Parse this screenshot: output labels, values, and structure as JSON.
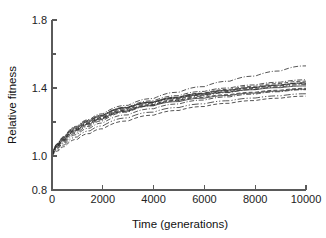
{
  "chart_data": {
    "type": "line",
    "title": "",
    "xlabel": "Time (generations)",
    "ylabel": "Relative fitness",
    "xlim": [
      0,
      10000
    ],
    "ylim": [
      0.8,
      1.8
    ],
    "grid": false,
    "legend": "none",
    "x_ticks": [
      0,
      2000,
      4000,
      6000,
      8000,
      10000
    ],
    "x_tick_labels": [
      "0",
      "2000",
      "4000",
      "6000",
      "8000",
      "10000"
    ],
    "y_ticks": [
      0.8,
      1.0,
      1.2,
      1.4,
      1.6,
      1.8
    ],
    "y_tick_labels": [
      "0.8",
      "1.0",
      "",
      "1.4",
      "",
      "1.8"
    ],
    "y_minor_ticks": [
      1.2,
      1.6
    ],
    "x": [
      0,
      250,
      500,
      1000,
      1500,
      2000,
      3000,
      4000,
      5000,
      6000,
      7000,
      8000,
      9000,
      10000
    ],
    "series": [
      {
        "name": "population-1",
        "style": "dash-dot",
        "values": [
          1.0,
          1.075,
          1.115,
          1.175,
          1.215,
          1.248,
          1.298,
          1.338,
          1.375,
          1.408,
          1.44,
          1.47,
          1.5,
          1.53
        ]
      },
      {
        "name": "population-2",
        "style": "dash-dot",
        "values": [
          1.0,
          1.07,
          1.108,
          1.165,
          1.205,
          1.238,
          1.288,
          1.325,
          1.355,
          1.38,
          1.4,
          1.418,
          1.434,
          1.448
        ]
      },
      {
        "name": "population-3",
        "style": "dashed",
        "values": [
          1.0,
          1.062,
          1.098,
          1.155,
          1.196,
          1.228,
          1.278,
          1.315,
          1.345,
          1.37,
          1.392,
          1.41,
          1.426,
          1.44
        ]
      },
      {
        "name": "population-4",
        "style": "solid",
        "values": [
          1.0,
          1.068,
          1.105,
          1.162,
          1.202,
          1.234,
          1.283,
          1.318,
          1.346,
          1.368,
          1.387,
          1.403,
          1.417,
          1.43
        ]
      },
      {
        "name": "population-5",
        "style": "dash-dot",
        "values": [
          1.0,
          1.058,
          1.092,
          1.148,
          1.19,
          1.222,
          1.272,
          1.31,
          1.34,
          1.364,
          1.385,
          1.402,
          1.417,
          1.43
        ]
      },
      {
        "name": "population-6",
        "style": "dashed",
        "values": [
          1.0,
          1.055,
          1.088,
          1.142,
          1.182,
          1.214,
          1.264,
          1.302,
          1.333,
          1.358,
          1.379,
          1.397,
          1.412,
          1.426
        ]
      },
      {
        "name": "population-7",
        "style": "solid",
        "values": [
          1.0,
          1.072,
          1.112,
          1.17,
          1.21,
          1.24,
          1.285,
          1.316,
          1.34,
          1.36,
          1.376,
          1.39,
          1.402,
          1.412
        ]
      },
      {
        "name": "population-8",
        "style": "dash-dot",
        "values": [
          1.0,
          1.05,
          1.082,
          1.135,
          1.175,
          1.207,
          1.258,
          1.296,
          1.327,
          1.352,
          1.373,
          1.391,
          1.406,
          1.42
        ]
      },
      {
        "name": "population-9",
        "style": "dashed",
        "values": [
          1.0,
          1.064,
          1.1,
          1.156,
          1.194,
          1.224,
          1.27,
          1.302,
          1.326,
          1.345,
          1.361,
          1.375,
          1.387,
          1.398
        ]
      },
      {
        "name": "population-10",
        "style": "solid",
        "values": [
          1.0,
          1.06,
          1.095,
          1.15,
          1.188,
          1.218,
          1.264,
          1.296,
          1.32,
          1.34,
          1.356,
          1.37,
          1.382,
          1.393
        ]
      },
      {
        "name": "population-11",
        "style": "dash-dot",
        "values": [
          1.0,
          1.045,
          1.075,
          1.126,
          1.164,
          1.194,
          1.242,
          1.278,
          1.306,
          1.329,
          1.348,
          1.364,
          1.378,
          1.39
        ]
      },
      {
        "name": "population-12",
        "style": "dash-dot-long",
        "values": [
          1.0,
          1.038,
          1.065,
          1.112,
          1.148,
          1.177,
          1.224,
          1.258,
          1.285,
          1.307,
          1.325,
          1.341,
          1.354,
          1.366
        ]
      },
      {
        "name": "population-13",
        "style": "dashed",
        "values": [
          1.0,
          1.03,
          1.055,
          1.098,
          1.132,
          1.16,
          1.206,
          1.24,
          1.268,
          1.291,
          1.31,
          1.326,
          1.34,
          1.352
        ]
      }
    ]
  },
  "axes": {
    "x_title": "Time (generations)",
    "y_title": "Relative fitness"
  }
}
